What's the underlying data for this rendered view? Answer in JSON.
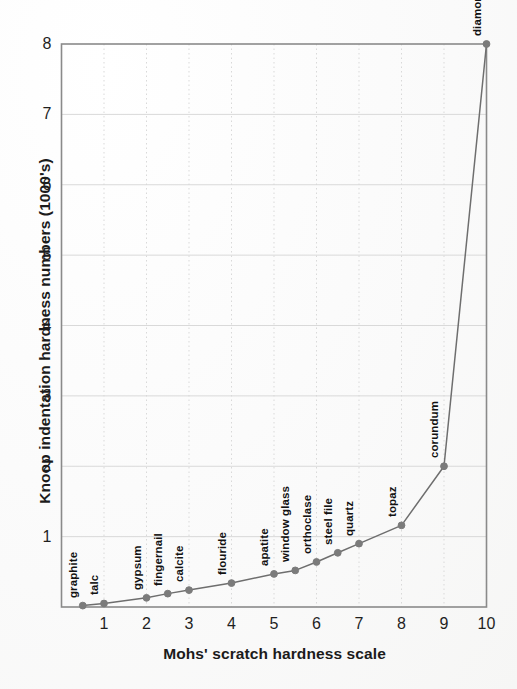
{
  "figure": {
    "background_color": "#fbfbfb",
    "plot_border_color": "#8a8a8a",
    "grid_color": "#d9d9d9",
    "line_color": "#6e6e6e",
    "marker_color": "#7b7b7b",
    "text_color": "#1b1b1b"
  },
  "chart_data": {
    "type": "line",
    "title": "",
    "xlabel": "Mohs' scratch hardness scale",
    "ylabel": "Knoop indentation hardness numbers (1000's)",
    "xlim": [
      0,
      10
    ],
    "ylim": [
      0,
      8
    ],
    "xticks": [
      1,
      2,
      3,
      4,
      5,
      6,
      7,
      8,
      9,
      10
    ],
    "xtick_labels": [
      "1",
      "2",
      "3",
      "4",
      "5",
      "6",
      "7",
      "8",
      "9",
      "10"
    ],
    "yticks": [
      1,
      2,
      3,
      4,
      5,
      6,
      7,
      8
    ],
    "ytick_labels": [
      "1",
      "2",
      "3",
      "4",
      "5",
      "6",
      "7",
      "8"
    ],
    "grid": true,
    "grid_style": "solid horizontal, dotted vertical",
    "legend": "none",
    "markers": true,
    "series": [
      {
        "name": "Knoop indentation hardness",
        "points": [
          {
            "label": "graphite",
            "x": 0.5,
            "y": 0.02
          },
          {
            "label": "talc",
            "x": 1.0,
            "y": 0.05
          },
          {
            "label": "gypsum",
            "x": 2.0,
            "y": 0.13
          },
          {
            "label": "fingernail",
            "x": 2.5,
            "y": 0.19
          },
          {
            "label": "calcite",
            "x": 3.0,
            "y": 0.24
          },
          {
            "label": "flouride",
            "x": 4.0,
            "y": 0.34
          },
          {
            "label": "apatite",
            "x": 5.0,
            "y": 0.47
          },
          {
            "label": "window glass",
            "x": 5.5,
            "y": 0.52
          },
          {
            "label": "orthoclase",
            "x": 6.0,
            "y": 0.64
          },
          {
            "label": "steel file",
            "x": 6.5,
            "y": 0.77
          },
          {
            "label": "quartz",
            "x": 7.0,
            "y": 0.9
          },
          {
            "label": "topaz",
            "x": 8.0,
            "y": 1.16
          },
          {
            "label": "corundum",
            "x": 9.0,
            "y": 2.0
          },
          {
            "label": "diamond",
            "x": 10.0,
            "y": 8.0
          }
        ]
      }
    ]
  },
  "point_label_offsets": [
    {
      "label": "graphite",
      "dx": -4,
      "dy": -8
    },
    {
      "label": "talc",
      "dx": -4,
      "dy": -8
    },
    {
      "label": "gypsum",
      "dx": -4,
      "dy": -8
    },
    {
      "label": "fingernail",
      "dx": -4,
      "dy": -8
    },
    {
      "label": "calcite",
      "dx": -4,
      "dy": -8
    },
    {
      "label": "flouride",
      "dx": -4,
      "dy": -8
    },
    {
      "label": "apatite",
      "dx": -4,
      "dy": -8
    },
    {
      "label": "window glass",
      "dx": -4,
      "dy": -8
    },
    {
      "label": "orthoclase",
      "dx": -4,
      "dy": -8
    },
    {
      "label": "steel file",
      "dx": -4,
      "dy": -8
    },
    {
      "label": "quartz",
      "dx": -4,
      "dy": -8
    },
    {
      "label": "topaz",
      "dx": -4,
      "dy": -8
    },
    {
      "label": "corundum",
      "dx": -4,
      "dy": -8
    },
    {
      "label": "diamond",
      "dx": -4,
      "dy": -8
    }
  ]
}
